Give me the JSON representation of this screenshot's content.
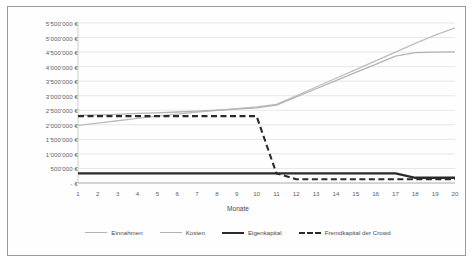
{
  "chart_data": {
    "type": "line",
    "title": "",
    "xlabel": "Monate",
    "ylabel": "",
    "x": [
      1,
      2,
      3,
      4,
      5,
      6,
      7,
      8,
      9,
      10,
      11,
      12,
      13,
      14,
      15,
      16,
      17,
      18,
      19,
      20
    ],
    "xticklabels": [
      "1",
      "2",
      "3",
      "4",
      "5",
      "6",
      "7",
      "8",
      "9",
      "10",
      "11",
      "12",
      "13",
      "14",
      "15",
      "16",
      "17",
      "18",
      "19",
      "20"
    ],
    "ylim": [
      0,
      5500000
    ],
    "yticks": [
      0,
      500000,
      1000000,
      1500000,
      2000000,
      2500000,
      3000000,
      3500000,
      4000000,
      4500000,
      5000000,
      5500000
    ],
    "yticklabels": [
      "- €",
      "500'000 €",
      "1'000'000 €",
      "1'500'000 €",
      "2'000'000 €",
      "2'500'000 €",
      "3'000'000 €",
      "3'500'000 €",
      "4'000'000 €",
      "4'500'000 €",
      "5'000'000 €",
      "5'500'000 €"
    ],
    "grid": true,
    "legend_position": "bottom",
    "series": [
      {
        "name": "Einnahmen",
        "style": "solid",
        "color": "#bdbdbd",
        "width": 1.3,
        "values": [
          1980000,
          2060000,
          2140000,
          2220000,
          2300000,
          2370000,
          2440000,
          2500000,
          2560000,
          2620000,
          2700000,
          3000000,
          3300000,
          3600000,
          3900000,
          4200000,
          4500000,
          4800000,
          5080000,
          5330000
        ]
      },
      {
        "name": "Kosten",
        "style": "solid",
        "color": "#b3b3b3",
        "width": 1.3,
        "values": [
          2320000,
          2340000,
          2360000,
          2390000,
          2410000,
          2440000,
          2470000,
          2500000,
          2540000,
          2580000,
          2680000,
          2960000,
          3240000,
          3520000,
          3800000,
          4080000,
          4360000,
          4480000,
          4500000,
          4510000
        ]
      },
      {
        "name": "Eigenkapital",
        "style": "solid",
        "color": "#2b2b2b",
        "width": 2.3,
        "values": [
          330000,
          330000,
          330000,
          330000,
          330000,
          330000,
          330000,
          330000,
          330000,
          330000,
          330000,
          330000,
          330000,
          330000,
          330000,
          330000,
          330000,
          180000,
          180000,
          180000
        ]
      },
      {
        "name": "Fremdkapital der Crowd",
        "style": "dashed",
        "color": "#2b2b2b",
        "width": 2.1,
        "values": [
          2300000,
          2300000,
          2300000,
          2300000,
          2300000,
          2300000,
          2300000,
          2300000,
          2300000,
          2300000,
          330000,
          130000,
          130000,
          130000,
          130000,
          130000,
          130000,
          130000,
          130000,
          130000
        ]
      }
    ]
  },
  "axes": {
    "x_title": "Monate"
  },
  "legend": {
    "items": [
      {
        "label": "Einnahmen",
        "swatch": "solid-light-line-icon"
      },
      {
        "label": "Kosten",
        "swatch": "solid-light-line-icon"
      },
      {
        "label": "Eigenkapital",
        "swatch": "solid-dark-line-icon"
      },
      {
        "label": "Fremdkapital der Crowd",
        "swatch": "dashed-dark-line-icon"
      }
    ]
  }
}
